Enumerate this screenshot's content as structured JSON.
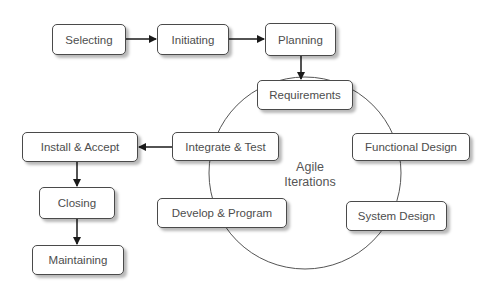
{
  "diagram": {
    "nodes": {
      "selecting": {
        "label": "Selecting"
      },
      "initiating": {
        "label": "Initiating"
      },
      "planning": {
        "label": "Planning"
      },
      "requirements": {
        "label": "Requirements"
      },
      "functional_design": {
        "label": "Functional Design"
      },
      "system_design": {
        "label": "System Design"
      },
      "develop_program": {
        "label": "Develop & Program"
      },
      "integrate_test": {
        "label": "Integrate & Test"
      },
      "install_accept": {
        "label": "Install & Accept"
      },
      "closing": {
        "label": "Closing"
      },
      "maintaining": {
        "label": "Maintaining"
      }
    },
    "cycle_label": {
      "line1": "Agile",
      "line2": "Iterations"
    },
    "edges": [
      {
        "from": "Selecting",
        "to": "Initiating",
        "type": "arrow"
      },
      {
        "from": "Initiating",
        "to": "Planning",
        "type": "arrow"
      },
      {
        "from": "Planning",
        "to": "Requirements",
        "type": "arrow"
      },
      {
        "from": "Requirements",
        "to": "Functional Design",
        "type": "cycle-arc"
      },
      {
        "from": "Functional Design",
        "to": "System Design",
        "type": "cycle-arc"
      },
      {
        "from": "System Design",
        "to": "Develop & Program",
        "type": "cycle-arc"
      },
      {
        "from": "Develop & Program",
        "to": "Integrate & Test",
        "type": "cycle-arc"
      },
      {
        "from": "Integrate & Test",
        "to": "Requirements",
        "type": "cycle-arc"
      },
      {
        "from": "Integrate & Test",
        "to": "Install & Accept",
        "type": "arrow"
      },
      {
        "from": "Install & Accept",
        "to": "Closing",
        "type": "arrow"
      },
      {
        "from": "Closing",
        "to": "Maintaining",
        "type": "arrow"
      }
    ],
    "colors": {
      "border": "#4a4a4a",
      "text": "#4d4d4d",
      "arrow": "#1a1a1a",
      "cycle": "#555555"
    }
  }
}
